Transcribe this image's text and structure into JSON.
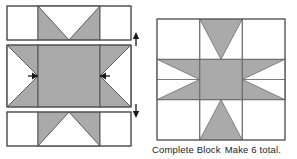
{
  "figure": {
    "colors": {
      "fabric_light": "#ffffff",
      "fabric_dark": "#aaaaaa",
      "outline": "#4d4d4d",
      "seam_line": "#6b6b6b",
      "arrow": "#1a1a1a",
      "background": "#ffffff",
      "text": "#1d1d1d"
    }
  },
  "left_diagram": {
    "name": "row-assembly-diagram",
    "description": "Three pieced rows stacked vertically, ready to be joined",
    "rows": [
      {
        "index": 1,
        "label": "top-row",
        "units": [
          {
            "position": "left",
            "type": "plain-square",
            "fill": "light"
          },
          {
            "position": "center",
            "type": "flying-geese-point-down",
            "fill": "dark",
            "triangle_fill": "light"
          },
          {
            "position": "right",
            "type": "plain-square",
            "fill": "light"
          }
        ]
      },
      {
        "index": 2,
        "label": "middle-row",
        "units": [
          {
            "position": "left",
            "type": "flying-geese-point-right",
            "fill": "dark",
            "triangle_fill": "light"
          },
          {
            "position": "center",
            "type": "plain-square",
            "fill": "dark"
          },
          {
            "position": "right",
            "type": "flying-geese-point-left",
            "fill": "dark",
            "triangle_fill": "light"
          }
        ]
      },
      {
        "index": 3,
        "label": "bottom-row",
        "units": [
          {
            "position": "left",
            "type": "plain-square",
            "fill": "light"
          },
          {
            "position": "center",
            "type": "flying-geese-point-up",
            "fill": "dark",
            "triangle_fill": "light"
          },
          {
            "position": "right",
            "type": "plain-square",
            "fill": "light"
          }
        ]
      }
    ],
    "arrows": [
      {
        "name": "press-seam-arrow-right",
        "direction": "right",
        "location": "middle-row-left-seam"
      },
      {
        "name": "press-seam-arrow-left",
        "direction": "left",
        "location": "middle-row-right-seam"
      },
      {
        "name": "join-rows-arrow-up",
        "direction": "up",
        "location": "right-of-rows-top"
      },
      {
        "name": "join-rows-arrow-down",
        "direction": "down",
        "location": "right-of-rows-bottom"
      }
    ]
  },
  "right_diagram": {
    "name": "complete-block-diagram",
    "description": "Finished sawtooth star block",
    "block_type": "sawtooth-star"
  },
  "caption": {
    "block_label": "Complete Block",
    "quantity_instruction": "Make 6 total.",
    "full_text": "Complete Block  Make 6 total."
  }
}
